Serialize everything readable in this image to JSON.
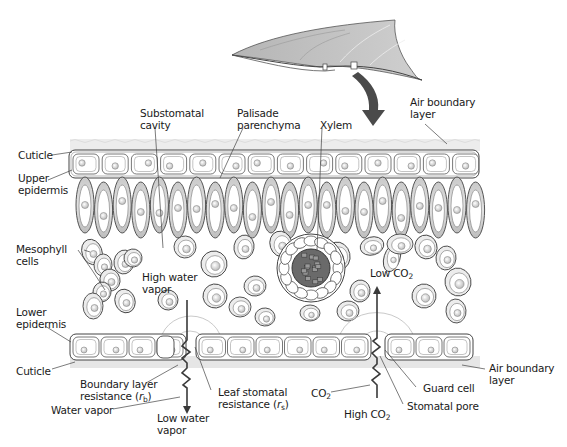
{
  "figure": {
    "colors": {
      "outline": "#3a3a3a",
      "cell_fill": "#ffffff",
      "palisade_shade": "#c4c4c4",
      "mesophyll_shade": "#e6e6e6",
      "boundary_layer": "#e4e4e4",
      "leaf_surface": "#bdbdbd",
      "arrow": "#555555",
      "text": "#1a1a1a"
    }
  },
  "labels": {
    "cuticle_top": "Cuticle",
    "upper_epidermis_1": "Upper",
    "upper_epidermis_2": "epidermis",
    "substomatal_1": "Substomatal",
    "substomatal_2": "cavity",
    "palisade_1": "Palisade",
    "palisade_2": "parenchyma",
    "xylem": "Xylem",
    "air_boundary_top_1": "Air boundary",
    "air_boundary_top_2": "layer",
    "mesophyll_1": "Mesophyll",
    "mesophyll_2": "cells",
    "high_water_1": "High water",
    "high_water_2": "vapor",
    "low_co2_text": "Low CO",
    "low_co2_sub": "2",
    "lower_epidermis_1": "Lower",
    "lower_epidermis_2": "epidermis",
    "cuticle_bottom": "Cuticle",
    "boundary_resistance_1": "Boundary layer",
    "boundary_resistance_2a": "resistance (",
    "boundary_resistance_r": "r",
    "boundary_resistance_sub": "b",
    "boundary_resistance_2b": ")",
    "stomatal_resistance_1": "Leaf stomatal",
    "stomatal_resistance_2a": "resistance (",
    "stomatal_resistance_r": "r",
    "stomatal_resistance_sub": "s",
    "stomatal_resistance_2b": ")",
    "water_vapor": "Water vapor",
    "low_water_1": "Low water",
    "low_water_2": "vapor",
    "co2_text": "CO",
    "co2_sub": "2",
    "high_co2_text": "High CO",
    "high_co2_sub": "2",
    "guard_cell": "Guard cell",
    "stomatal_pore": "Stomatal pore",
    "air_boundary_bottom_1": "Air boundary",
    "air_boundary_bottom_2": "layer"
  }
}
